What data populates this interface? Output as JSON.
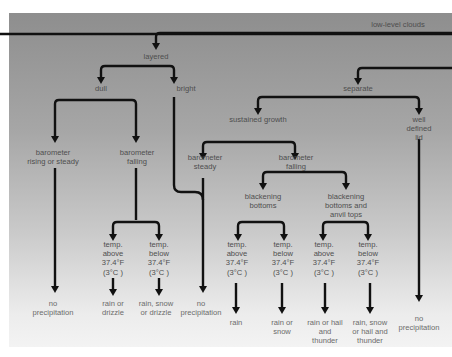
{
  "diagram": {
    "title": "low-level clouds",
    "colors": {
      "line": "#111111",
      "panel_top": "#8e8e8e",
      "panel_bottom": "#f3f3f3",
      "text": "#4e4e4e"
    },
    "nodes": {
      "root": "low-level clouds",
      "layered": "layered",
      "dull": "dull",
      "bright": "bright",
      "separate": "separate",
      "sustained_growth": "sustained growth",
      "well_defined_lid": "well defined\nlid",
      "baro_rising": "barometer\nrising or steady",
      "baro_falling_dull": "barometer\nfalling",
      "baro_steady": "barometer\nsteady",
      "baro_falling_growth": "barometer\nfalling",
      "blackening_bottoms": "blackening\nbottoms",
      "blackening_anvil": "blackening\nbottoms and\nanvil tops",
      "temp_above_1": "temp.\nabove\n37.4°F\n(3°C )",
      "temp_below_1": "temp.\nbelow\n37.4°F\n(3°C )",
      "temp_above_2": "temp.\nabove\n37.4°F\n(3°C )",
      "temp_below_2": "temp.\nbelow\n37.4°F\n(3°C )",
      "temp_above_3": "temp.\nabove\n37.4°F\n(3°C )",
      "temp_below_3": "temp.\nbelow\n37.4°F\n(3°C )"
    },
    "outcomes": {
      "no_precip_1": "no\nprecipitation",
      "rain_or_drizzle": "rain or\ndrizzle",
      "rain_snow_drizzle": "rain, snow\nor drizzle",
      "no_precip_2": "no\nprecipitation",
      "rain": "rain",
      "rain_or_snow": "rain or\nsnow",
      "rain_hail_thunder": "rain or hail\nand\nthunder",
      "rain_snow_hail_thunder": "rain, snow\nor hail and\nthunder",
      "no_precip_3": "no\nprecipitation"
    }
  }
}
